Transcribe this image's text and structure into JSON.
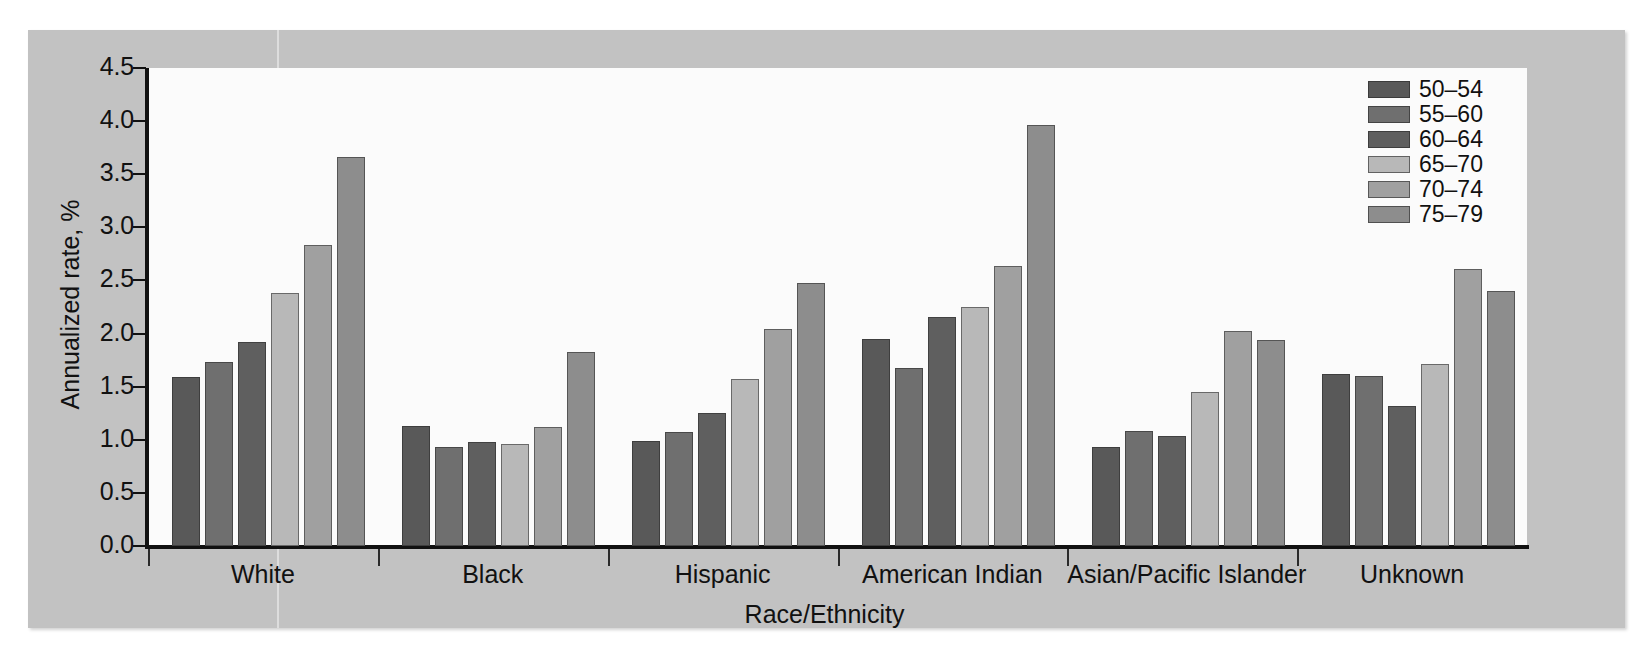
{
  "figure": {
    "background_color": "#c2c2c2",
    "plot_background_color": "#fbfbfb",
    "axis_color": "#111111"
  },
  "chart_data": {
    "type": "bar",
    "title": "",
    "xlabel": "Race/Ethnicity",
    "ylabel": "Annualized rate, %",
    "ylim": [
      0.0,
      4.5
    ],
    "yticks": [
      "0.0",
      "0.5",
      "1.0",
      "1.5",
      "2.0",
      "2.5",
      "3.0",
      "3.5",
      "4.0",
      "4.5"
    ],
    "ytick_values": [
      0.0,
      0.5,
      1.0,
      1.5,
      2.0,
      2.5,
      3.0,
      3.5,
      4.0,
      4.5
    ],
    "grid": false,
    "legend_position": "top-right",
    "legend_title": "",
    "categories": [
      "White",
      "Black",
      "Hispanic",
      "American Indian",
      "Asian/Pacific Islander",
      "Unknown"
    ],
    "series": [
      {
        "name": "50–54",
        "color": "#595959",
        "values": [
          1.59,
          1.13,
          0.99,
          1.95,
          0.93,
          1.62
        ]
      },
      {
        "name": "55–60",
        "color": "#6f6f6f",
        "values": [
          1.73,
          0.93,
          1.07,
          1.68,
          1.08,
          1.6
        ]
      },
      {
        "name": "60–64",
        "color": "#5f5f5f",
        "values": [
          1.92,
          0.98,
          1.25,
          2.16,
          1.04,
          1.32
        ]
      },
      {
        "name": "65–70",
        "color": "#b8b8b8",
        "values": [
          2.38,
          0.96,
          1.57,
          2.25,
          1.45,
          1.71
        ]
      },
      {
        "name": "70–74",
        "color": "#a0a0a0",
        "values": [
          2.83,
          1.12,
          2.04,
          2.64,
          2.02,
          2.61
        ]
      },
      {
        "name": "75–79",
        "color": "#8d8d8d",
        "values": [
          3.66,
          1.83,
          2.48,
          3.96,
          1.94,
          2.4
        ]
      }
    ]
  }
}
